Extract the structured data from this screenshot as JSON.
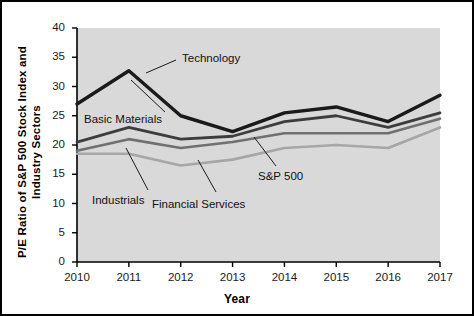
{
  "chart_data": {
    "type": "line",
    "title": "",
    "xlabel": "Year",
    "ylabel": "P/E Ratio of S&P 500 Stock Index and Industry Sectors",
    "categories": [
      "2010",
      "2011",
      "2012",
      "2013",
      "2014",
      "2015",
      "2016",
      "2017"
    ],
    "x": [
      2010,
      2011,
      2012,
      2013,
      2014,
      2015,
      2016,
      2017
    ],
    "xlim": [
      2010,
      2017
    ],
    "ylim": [
      0,
      40
    ],
    "yticks": [
      "0",
      "5",
      "10",
      "15",
      "20",
      "25",
      "30",
      "35",
      "40"
    ],
    "ytick_values": [
      0,
      5,
      10,
      15,
      20,
      25,
      30,
      35,
      40
    ],
    "grid": false,
    "legend_position": "inline-annotations",
    "plot_background": "#d9d9d9",
    "series": [
      {
        "name": "Technology",
        "color": "#1a1a1a",
        "width": 3.4,
        "values": [
          27.0,
          32.7,
          25.0,
          22.3,
          25.5,
          26.5,
          24.0,
          28.5
        ]
      },
      {
        "name": "Basic Materials",
        "color": "#3d3d3d",
        "width": 2.8,
        "values": [
          20.5,
          23.0,
          21.0,
          21.5,
          24.0,
          25.0,
          23.0,
          25.5
        ]
      },
      {
        "name": "S&P 500",
        "color": "#707070",
        "width": 2.6,
        "values": [
          19.0,
          21.0,
          19.5,
          20.5,
          22.0,
          22.0,
          22.0,
          24.5
        ]
      },
      {
        "name": "Financial Services",
        "color": "#a6a6a6",
        "width": 2.6,
        "values": [
          18.5,
          18.5,
          16.5,
          17.5,
          19.5,
          20.0,
          19.5,
          23.0
        ]
      }
    ],
    "annotations": [
      {
        "text": "Technology",
        "label_x": 182,
        "label_y": 52,
        "leader": [
          176,
          60,
          146,
          73
        ]
      },
      {
        "text": "Basic Materials",
        "label_x": 84,
        "label_y": 113,
        "leader": [
          165,
          112,
          131,
          80
        ]
      },
      {
        "text": "Industrials",
        "label_x": 92,
        "label_y": 194,
        "leader": [
          148,
          190,
          126,
          148
        ]
      },
      {
        "text": "Financial Services",
        "label_x": 152,
        "label_y": 198,
        "leader": [
          216,
          192,
          198,
          160
        ]
      },
      {
        "text": "S&P 500",
        "label_x": 258,
        "label_y": 170,
        "leader": [
          276,
          166,
          254,
          137
        ]
      }
    ]
  },
  "axes": {
    "x_title": "Year",
    "y_title_line1": "P/E Ratio of S&P 500 Stock Index and",
    "y_title_line2": "Industry Sectors"
  }
}
